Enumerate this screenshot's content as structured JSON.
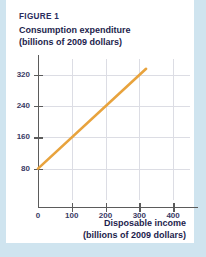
{
  "figure": {
    "label": "FIGURE 1",
    "title_line1": "Consumption expenditure",
    "title_line2": "(billions of 2009 dollars)",
    "xcaption_line1": "Disposable income",
    "xcaption_line2": "(billions of 2009 dollars)"
  },
  "colors": {
    "line": "#E8A33D",
    "title_text": "#1d1d4d",
    "tick_text": "#3a3a64",
    "axis": "#5b5b5b",
    "grid": "#dcdde4",
    "page_background": "#cfe4ef",
    "card_background": "#ffffff"
  },
  "chart_data": {
    "type": "line",
    "title": "Consumption expenditure (billions of 2009 dollars)",
    "xlabel": "Disposable income (billions of 2009 dollars)",
    "ylabel": "Consumption expenditure (billions of 2009 dollars)",
    "xlim": [
      0,
      450
    ],
    "ylim": [
      0,
      360
    ],
    "xticks": [
      0,
      100,
      200,
      300,
      400
    ],
    "yticks": [
      80,
      160,
      240,
      320
    ],
    "grid": true,
    "legend": "none",
    "series": [
      {
        "name": "Consumption function",
        "color": "#E8A33D",
        "x": [
          0,
          320
        ],
        "y": [
          80,
          335
        ]
      }
    ]
  }
}
